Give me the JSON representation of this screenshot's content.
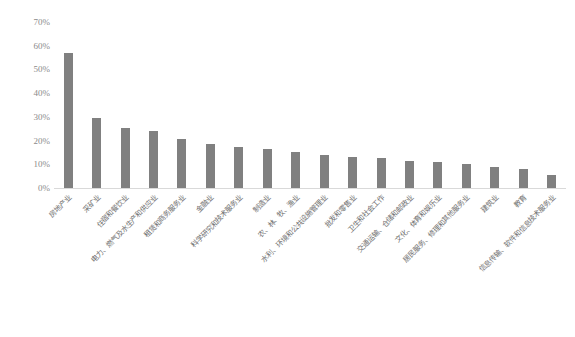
{
  "chart_data": {
    "type": "bar",
    "title": "",
    "subtitle": "",
    "xlabel": "",
    "ylabel": "",
    "ylim": [
      0,
      70
    ],
    "ytick_labels": [
      "70%",
      "60%",
      "50%",
      "40%",
      "30%",
      "20%",
      "10%",
      "0%"
    ],
    "ytick_values": [
      70,
      60,
      50,
      40,
      30,
      20,
      10,
      0
    ],
    "grid": false,
    "legend": "none",
    "bar_color": "#808080",
    "axis_color": "#d9d9d9",
    "tick_label_color": "#8a8a8a",
    "categories": [
      "房地产业",
      "采矿业",
      "住宿和餐饮业",
      "电力、燃气及水生产和供应业",
      "租赁和商务服务业",
      "金融业",
      "科学研究和技术服务业",
      "制造业",
      "农、林、牧、渔业",
      "水利、环境和公共设施管理业",
      "批发和零售业",
      "卫生和社会工作",
      "交通运输、仓储和邮政业",
      "文化、体育和娱乐业",
      "居民服务、修理和其他服务业",
      "建筑业",
      "教育",
      "信息传输、软件和信息技术服务业"
    ],
    "values": [
      57,
      29.5,
      25.5,
      24,
      20.5,
      18.5,
      17.5,
      16.5,
      15,
      14,
      13,
      12.5,
      11.5,
      11,
      10,
      9,
      8,
      5.5
    ]
  }
}
